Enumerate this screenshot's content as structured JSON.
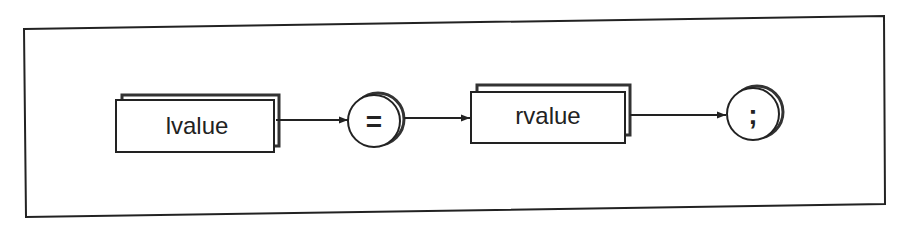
{
  "diagram": {
    "type": "syntax-diagram",
    "frame": {
      "stroke": "#222222"
    },
    "nodes": [
      {
        "id": "lvalue",
        "kind": "nonterminal",
        "label": "lvalue"
      },
      {
        "id": "assign",
        "kind": "terminal",
        "label": "="
      },
      {
        "id": "rvalue",
        "kind": "nonterminal",
        "label": "rvalue"
      },
      {
        "id": "semicolon",
        "kind": "terminal",
        "label": ";"
      }
    ],
    "edges": [
      {
        "from": "lvalue",
        "to": "assign"
      },
      {
        "from": "assign",
        "to": "rvalue"
      },
      {
        "from": "rvalue",
        "to": "semicolon"
      }
    ],
    "colors": {
      "line": "#222222",
      "shadow": "#333333",
      "fill": "#ffffff"
    }
  }
}
